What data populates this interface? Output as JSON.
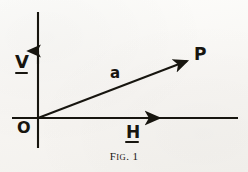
{
  "figure": {
    "caption_prefix": "F",
    "caption_smallcaps": "IG",
    "caption_suffix": ". 1",
    "caption_full": "Fig. 1",
    "ink_color": "#17150f",
    "paper_color": "#fbfaf8"
  },
  "axes": {
    "origin_label": "O",
    "vertical": {
      "label": "V",
      "underlined": true,
      "direction": "up",
      "arrowhead": true
    },
    "horizontal": {
      "label": "H",
      "underlined": true,
      "direction": "right",
      "arrowhead": true
    }
  },
  "vector": {
    "label": "a",
    "underlined": false,
    "terminal_point_label": "P",
    "from": "O",
    "to": "P",
    "arrowhead": true
  },
  "geometry": {
    "origin_x": 38,
    "origin_y": 118,
    "v_axis_top_y": 12,
    "v_axis_bottom_y": 148,
    "v_arrow_tip_y": 52,
    "h_axis_right_x": 238,
    "h_arrow_tip_x": 162,
    "vector_tip_x": 190,
    "vector_tip_y": 60
  }
}
